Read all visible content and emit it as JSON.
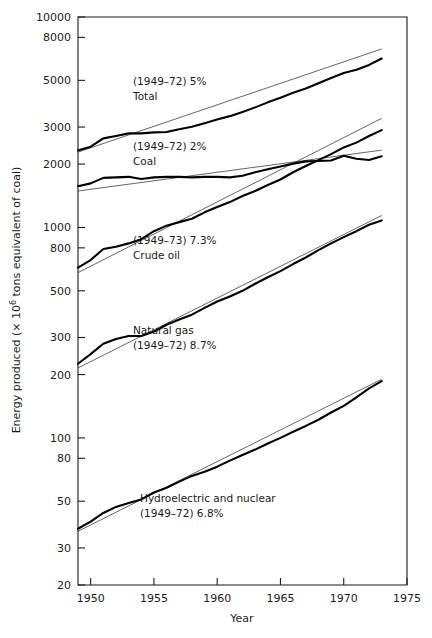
{
  "chart_data": {
    "type": "line",
    "title": "",
    "xlabel": "Year",
    "ylabel": "Energy produced (× 10⁶ tons equivalent of coal)",
    "xscale": "linear",
    "yscale": "log",
    "xlim": [
      1949,
      1975
    ],
    "ylim": [
      20,
      10000
    ],
    "grid": false,
    "legend_position": "inline-annotations",
    "xticks": [
      1950,
      1955,
      1960,
      1965,
      1970,
      1975
    ],
    "xticklabels": [
      "1950",
      "1955",
      "1960",
      "1965",
      "1970",
      "1975"
    ],
    "yticks": [
      20,
      30,
      50,
      80,
      100,
      200,
      300,
      500,
      800,
      1000,
      2000,
      3000,
      5000,
      8000,
      10000
    ],
    "yticklabels": [
      "20",
      "30",
      "50",
      "80",
      "100",
      "200",
      "300",
      "500",
      "800",
      "1000",
      "2000",
      "3000",
      "5000",
      "8000",
      "10000"
    ],
    "series": [
      {
        "name": "Total",
        "period": "(1949–72)",
        "growth_rate": "5%",
        "annotation_line1": "(1949–72) 5%",
        "annotation_line2": "Total",
        "x": [
          1949,
          1950,
          1951,
          1952,
          1953,
          1954,
          1955,
          1956,
          1957,
          1958,
          1959,
          1960,
          1961,
          1962,
          1963,
          1964,
          1965,
          1966,
          1967,
          1968,
          1969,
          1970,
          1971,
          1972,
          1973
        ],
        "values": [
          2320,
          2420,
          2650,
          2720,
          2800,
          2800,
          2830,
          2840,
          2930,
          3010,
          3130,
          3260,
          3380,
          3540,
          3720,
          3930,
          4130,
          4370,
          4570,
          4840,
          5130,
          5420,
          5620,
          5920,
          6350
        ],
        "fit_x": [
          1949,
          1973
        ],
        "fit_values": [
          2280,
          7050
        ]
      },
      {
        "name": "Coal",
        "period": "(1949–72)",
        "growth_rate": "2%",
        "annotation_line1": "(1949–72) 2%",
        "annotation_line2": "Coal",
        "x": [
          1949,
          1950,
          1951,
          1952,
          1953,
          1954,
          1955,
          1956,
          1957,
          1958,
          1959,
          1960,
          1961,
          1962,
          1963,
          1964,
          1965,
          1966,
          1967,
          1968,
          1969,
          1970,
          1971,
          1972,
          1973
        ],
        "values": [
          1570,
          1620,
          1720,
          1730,
          1740,
          1700,
          1730,
          1740,
          1740,
          1730,
          1740,
          1740,
          1730,
          1760,
          1830,
          1890,
          1950,
          2010,
          2060,
          2070,
          2080,
          2190,
          2120,
          2090,
          2180
        ],
        "fit_x": [
          1949,
          1973
        ],
        "fit_values": [
          1490,
          2330
        ]
      },
      {
        "name": "Crude oil",
        "period": "(1949–73)",
        "growth_rate": "7.3%",
        "annotation_line1": "(1949–73) 7.3%",
        "annotation_line2": "Crude oil",
        "x": [
          1949,
          1950,
          1951,
          1952,
          1953,
          1954,
          1955,
          1956,
          1957,
          1958,
          1959,
          1960,
          1961,
          1962,
          1963,
          1964,
          1965,
          1966,
          1967,
          1968,
          1969,
          1970,
          1971,
          1972,
          1973
        ],
        "values": [
          645,
          700,
          790,
          810,
          840,
          880,
          960,
          1020,
          1060,
          1100,
          1180,
          1250,
          1320,
          1410,
          1490,
          1590,
          1690,
          1830,
          1960,
          2090,
          2230,
          2400,
          2530,
          2720,
          2900
        ],
        "fit_x": [
          1949,
          1973
        ],
        "fit_values": [
          610,
          3300
        ]
      },
      {
        "name": "Natural gas",
        "period": "(1949–72)",
        "growth_rate": "8.7%",
        "annotation_line1": "Natural gas",
        "annotation_line2": "(1949–72) 8.7%",
        "x": [
          1949,
          1950,
          1951,
          1952,
          1953,
          1954,
          1955,
          1956,
          1957,
          1958,
          1959,
          1960,
          1961,
          1962,
          1963,
          1964,
          1965,
          1966,
          1967,
          1968,
          1969,
          1970,
          1971,
          1972,
          1973
        ],
        "values": [
          225,
          250,
          280,
          295,
          305,
          305,
          320,
          345,
          365,
          385,
          415,
          445,
          470,
          500,
          540,
          580,
          620,
          670,
          720,
          780,
          840,
          900,
          960,
          1030,
          1080
        ],
        "fit_x": [
          1949,
          1973
        ],
        "fit_values": [
          215,
          1140
        ]
      },
      {
        "name": "Hydroelectric and nuclear",
        "period": "(1949–72)",
        "growth_rate": "6.8%",
        "annotation_line1": "Hydroelectric and nuclear",
        "annotation_line2": "(1949–72) 6.8%",
        "x": [
          1949,
          1950,
          1951,
          1952,
          1953,
          1954,
          1955,
          1956,
          1957,
          1958,
          1959,
          1960,
          1961,
          1962,
          1963,
          1964,
          1965,
          1966,
          1967,
          1968,
          1969,
          1970,
          1971,
          1972,
          1973
        ],
        "values": [
          37,
          40,
          44,
          47,
          49,
          51,
          55,
          58,
          62,
          66,
          69,
          73,
          78,
          83,
          88,
          94,
          100,
          107,
          114,
          122,
          132,
          142,
          156,
          172,
          186
        ],
        "fit_x": [
          1949,
          1973
        ],
        "fit_values": [
          36,
          190
        ]
      }
    ],
    "annotations": [
      {
        "text": "(1949–72) 5%",
        "x_px": 133,
        "y_px": 85
      },
      {
        "text": "Total",
        "x_px": 133,
        "y_px": 100
      },
      {
        "text": "(1949–72) 2%",
        "x_px": 133,
        "y_px": 150
      },
      {
        "text": "Coal",
        "x_px": 133,
        "y_px": 165
      },
      {
        "text": "(1949–73) 7.3%",
        "x_px": 133,
        "y_px": 244
      },
      {
        "text": "Crude oil",
        "x_px": 133,
        "y_px": 259
      },
      {
        "text": "Natural gas",
        "x_px": 133,
        "y_px": 334
      },
      {
        "text": "(1949–72) 8.7%",
        "x_px": 133,
        "y_px": 349
      },
      {
        "text": "Hydroelectric and nuclear",
        "x_px": 140,
        "y_px": 502
      },
      {
        "text": "(1949–72) 6.8%",
        "x_px": 140,
        "y_px": 517
      }
    ]
  },
  "axis": {
    "ylabel_full": "Energy produced (× 10⁶ tons equivalent of coal)",
    "ylabel_prefix": "Energy produced (× 10",
    "ylabel_exponent": "6",
    "ylabel_suffix": " tons equivalent of coal)",
    "xlabel": "Year"
  },
  "colors": {
    "ink": "#1a1a1a",
    "data_line": "#000000",
    "fit_line": "#222222",
    "background": "#ffffff"
  }
}
